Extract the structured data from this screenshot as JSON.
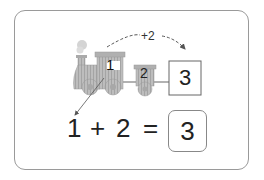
{
  "diagram": {
    "type": "addition-train-illustration",
    "arc_label": "+2",
    "engine_number": "1",
    "carriage_number": "2",
    "result_box_number": "3",
    "equation": {
      "operand1": "1",
      "operator": "+",
      "operand2": "2",
      "equals": "=",
      "answer": "3"
    },
    "colors": {
      "card_border": "#9a9a9a",
      "train_fill": "#b8b8b8",
      "train_stripe": "#9c9c9c",
      "text": "#222222"
    }
  }
}
